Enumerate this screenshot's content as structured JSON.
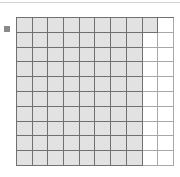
{
  "chart_data": {
    "type": "waffle",
    "title": "",
    "grid": {
      "rows": 10,
      "cols": 10
    },
    "total_cells": 100,
    "filled_cells": 81,
    "value_percent": 81,
    "fill_order": "row-major from top-left; top row 9 filled, other rows 8 filled",
    "row_filled_counts": [
      9,
      8,
      8,
      8,
      8,
      8,
      8,
      8,
      8,
      8
    ],
    "legend": [
      {
        "label": "",
        "color": "#8a8a8a"
      }
    ],
    "colors": {
      "filled": "#e2e2e2",
      "empty": "#ffffff",
      "gridline": "#707070"
    }
  }
}
